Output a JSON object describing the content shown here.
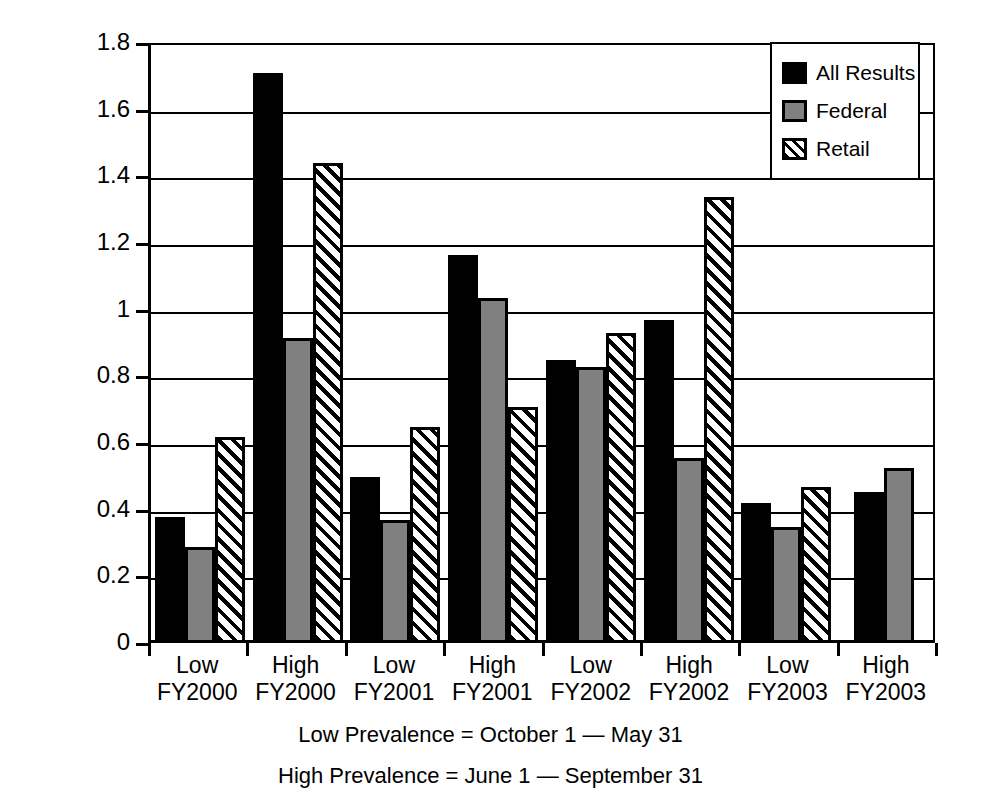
{
  "chart_data": {
    "type": "bar",
    "title": "",
    "xlabel": "",
    "ylabel": "Percentage positive",
    "ylim": [
      0,
      1.8
    ],
    "ytick_values": [
      0,
      0.2,
      0.4,
      0.6,
      0.8,
      1,
      1.2,
      1.4,
      1.6,
      1.8
    ],
    "ytick_labels": [
      "0",
      "0.2",
      "0.4",
      "0.6",
      "0.8",
      "1",
      "1.2",
      "1.4",
      "1.6",
      "1.8"
    ],
    "grid": true,
    "legend_position": "top-right",
    "categories": [
      "Low FY2000",
      "High FY2000",
      "Low FY2001",
      "High FY2001",
      "Low FY2002",
      "High FY2002",
      "Low FY2003",
      "High FY2003"
    ],
    "category_lines": [
      [
        "Low",
        "FY2000"
      ],
      [
        "High",
        "FY2000"
      ],
      [
        "Low",
        "FY2001"
      ],
      [
        "High",
        "FY2001"
      ],
      [
        "Low",
        "FY2002"
      ],
      [
        "High",
        "FY2002"
      ],
      [
        "Low",
        "FY2003"
      ],
      [
        "High",
        "FY2003"
      ]
    ],
    "series": [
      {
        "name": "All Results",
        "fill": "solid-black",
        "color": "#000000",
        "values": [
          0.37,
          1.7,
          0.49,
          1.155,
          0.84,
          0.96,
          0.41,
          0.445
        ]
      },
      {
        "name": "Federal",
        "fill": "solid-gray",
        "color": "#808080",
        "values": [
          0.28,
          0.905,
          0.36,
          1.025,
          0.82,
          0.545,
          0.34,
          0.515
        ]
      },
      {
        "name": "Retail",
        "fill": "diagonal-hatch",
        "color": "#ffffff",
        "values": [
          0.61,
          1.43,
          0.64,
          0.7,
          0.92,
          1.33,
          0.46,
          null
        ]
      }
    ],
    "annotations": [
      "Low Prevalence = October 1 — May 31",
      "High Prevalence = June 1 — September 31"
    ]
  },
  "legend": {
    "items": [
      {
        "label": "All Results"
      },
      {
        "label": "Federal"
      },
      {
        "label": "Retail"
      }
    ]
  },
  "footnotes": {
    "line1": "Low Prevalence = October 1 — May 31",
    "line2": "High Prevalence = June 1 — September 31"
  }
}
